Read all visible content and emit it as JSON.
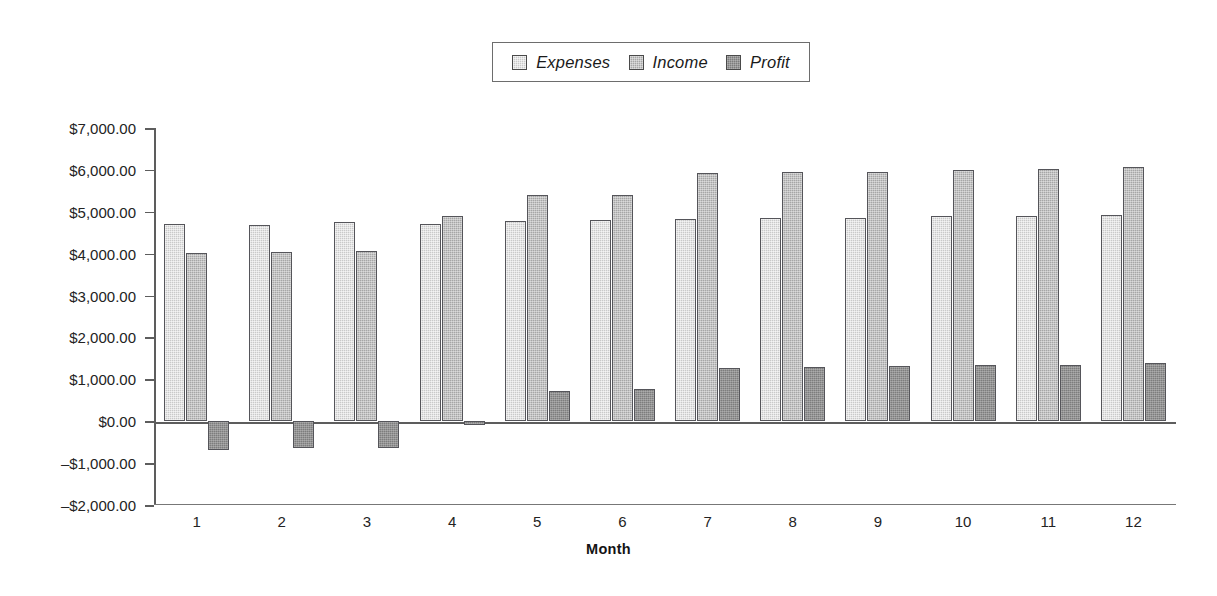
{
  "chart_data": {
    "type": "bar",
    "title": "",
    "xlabel": "Month",
    "ylabel": "",
    "categories": [
      "1",
      "2",
      "3",
      "4",
      "5",
      "6",
      "7",
      "8",
      "9",
      "10",
      "11",
      "12"
    ],
    "ylim": [
      -2000,
      7000
    ],
    "ytick_values": [
      7000,
      6000,
      5000,
      4000,
      3000,
      2000,
      1000,
      0,
      -1000,
      -2000
    ],
    "ytick_labels": [
      "$7,000.00",
      "$6,000.00",
      "$5,000.00",
      "$4,000.00",
      "$3,000.00",
      "$2,000.00",
      "$1,000.00",
      "$0.00",
      "–$1,000.00",
      "–$2,000.00"
    ],
    "grid": false,
    "legend_position": "top-center",
    "series": [
      {
        "name": "Expenses",
        "color": "#c9c9c9",
        "values": [
          4700,
          4680,
          4750,
          4720,
          4790,
          4810,
          4820,
          4840,
          4860,
          4890,
          4910,
          4920
        ]
      },
      {
        "name": "Income",
        "color": "#a6a6a6",
        "values": [
          4020,
          4030,
          4060,
          4900,
          5400,
          5390,
          5930,
          5950,
          5960,
          5990,
          6020,
          6060
        ]
      },
      {
        "name": "Profit",
        "color": "#7d7d7d",
        "values": [
          -680,
          -650,
          -630,
          -90,
          720,
          760,
          1260,
          1290,
          1320,
          1340,
          1350,
          1390
        ]
      }
    ]
  },
  "legend": {
    "items": [
      {
        "label": "Expenses",
        "swatch": "#c9c9c9"
      },
      {
        "label": "Income",
        "swatch": "#a6a6a6"
      },
      {
        "label": "Profit",
        "swatch": "#7d7d7d"
      }
    ]
  },
  "axis": {
    "x_title": "Month"
  }
}
